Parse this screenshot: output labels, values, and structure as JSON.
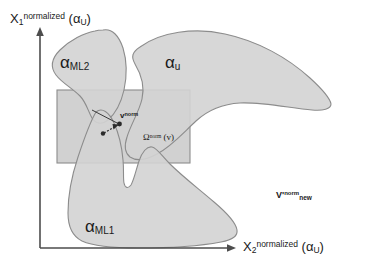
{
  "figure": {
    "background_color": "#ffffff",
    "blob_fill": "#d3d3d3",
    "blob_stroke": "#8c8c8c",
    "rect_fill": "#c9c9c9",
    "rect_stroke": "#8c8c8c",
    "axis_color": "#4d4d4d",
    "text_color": "#1a1a1a"
  },
  "axes": {
    "y": {
      "symbol": "X",
      "index": "1",
      "superscript": "normalized",
      "argument_open": "(",
      "argument": "α",
      "argument_sub": "U",
      "argument_close": ")"
    },
    "x": {
      "symbol": "X",
      "index": "2",
      "superscript": "normalized",
      "argument_open": "(",
      "argument": "α",
      "argument_sub": "U",
      "argument_close": ")"
    }
  },
  "regions": [
    {
      "id": "alpha-ml2",
      "alpha": "α",
      "subscript": "ML2",
      "description": "upper-left machine-learning region"
    },
    {
      "id": "alpha-u",
      "alpha": "α",
      "subscript": "u",
      "description": "upper-right crescent uncertainty region"
    },
    {
      "id": "alpha-ml1",
      "alpha": "α",
      "subscript": "ML1",
      "description": "lower machine-learning region"
    }
  ],
  "annotations": {
    "v_norm": {
      "base": "v",
      "superscript": "norm"
    },
    "omega_norm": {
      "base": "Ω",
      "superscript": "norm",
      "argument": "(v)"
    },
    "v_norm_new": {
      "base": "V'",
      "superscript": "norm",
      "subscript": "new"
    }
  }
}
